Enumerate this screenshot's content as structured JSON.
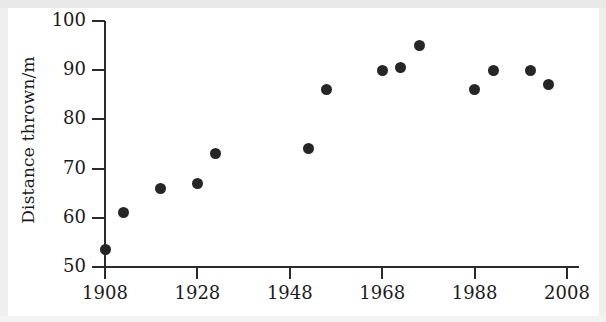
{
  "chart_data": {
    "type": "scatter",
    "title": "",
    "xlabel": "",
    "ylabel": "Distance thrown/m",
    "xlim": [
      1908,
      2008
    ],
    "ylim": [
      50,
      100
    ],
    "grid": false,
    "legend": null,
    "x_ticks": [
      "1908",
      "1928",
      "1948",
      "1968",
      "1988",
      "2008"
    ],
    "x_tick_values": [
      1908,
      1928,
      1948,
      1968,
      1988,
      2008
    ],
    "y_ticks": [
      "50",
      "60",
      "70",
      "80",
      "90",
      "100"
    ],
    "y_tick_values": [
      50,
      60,
      70,
      80,
      90,
      100
    ],
    "x": [
      1908,
      1912,
      1920,
      1928,
      1932,
      1952,
      1956,
      1968,
      1972,
      1976,
      1988,
      1992,
      2000,
      2004
    ],
    "y": [
      53.5,
      61,
      66,
      67,
      73,
      74,
      86,
      90,
      90.5,
      95,
      86,
      90,
      90,
      87
    ],
    "points": [
      {
        "x": 1908,
        "y": 53.5
      },
      {
        "x": 1912,
        "y": 61
      },
      {
        "x": 1920,
        "y": 66
      },
      {
        "x": 1928,
        "y": 67
      },
      {
        "x": 1932,
        "y": 73
      },
      {
        "x": 1952,
        "y": 74
      },
      {
        "x": 1956,
        "y": 86
      },
      {
        "x": 1968,
        "y": 90
      },
      {
        "x": 1972,
        "y": 90.5
      },
      {
        "x": 1976,
        "y": 95
      },
      {
        "x": 1988,
        "y": 86
      },
      {
        "x": 1992,
        "y": 90
      },
      {
        "x": 2000,
        "y": 90
      },
      {
        "x": 2004,
        "y": 87
      }
    ],
    "marker_color": "#262626",
    "axis_color": "#2b2b2b"
  }
}
